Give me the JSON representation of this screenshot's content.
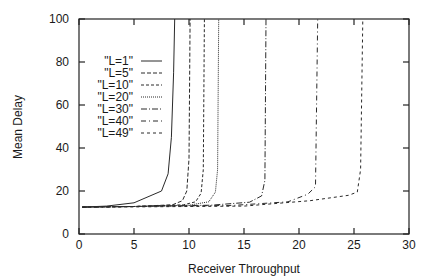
{
  "chart_data": {
    "type": "line",
    "title": "",
    "xlabel": "Receiver Throughput",
    "ylabel": "Mean Delay",
    "xlim": [
      0,
      30
    ],
    "ylim": [
      0,
      100
    ],
    "xticks": [
      0,
      5,
      10,
      15,
      20,
      25,
      30
    ],
    "yticks": [
      0,
      20,
      40,
      60,
      80,
      100
    ],
    "grid": false,
    "legend_position": "upper-left (inside)",
    "series": [
      {
        "name": "\"L=1\"",
        "dash": "",
        "x": [
          0.3,
          2.5,
          5.0,
          7.5,
          8.1,
          8.4,
          8.6,
          8.7
        ],
        "y": [
          12.5,
          13.0,
          14.5,
          20.0,
          28.0,
          45.0,
          75.0,
          100.0
        ]
      },
      {
        "name": "\"L=5\"",
        "dash": "4,2",
        "x": [
          0.3,
          5.0,
          8.5,
          9.4,
          9.8,
          10.0,
          10.1
        ],
        "y": [
          12.5,
          12.8,
          13.6,
          15.5,
          20.0,
          35.0,
          100.0
        ]
      },
      {
        "name": "\"L=10\"",
        "dash": "3,2",
        "x": [
          0.3,
          5.0,
          9.5,
          10.6,
          11.1,
          11.3,
          11.4
        ],
        "y": [
          12.5,
          12.8,
          13.6,
          15.0,
          19.0,
          30.0,
          100.0
        ]
      },
      {
        "name": "\"L=20\"",
        "dash": "1,1",
        "x": [
          0.3,
          5.0,
          10.0,
          11.8,
          12.4,
          12.6,
          12.7
        ],
        "y": [
          12.5,
          12.8,
          13.4,
          15.0,
          19.5,
          30.0,
          100.0
        ]
      },
      {
        "name": "\"L=30\"",
        "dash": "6,2,1,2",
        "x": [
          0.3,
          5.0,
          12.0,
          15.5,
          16.6,
          16.9,
          17.0
        ],
        "y": [
          12.5,
          12.8,
          13.4,
          14.8,
          17.7,
          25.0,
          100.0
        ]
      },
      {
        "name": "\"L=40\"",
        "dash": "5,3,1,3",
        "x": [
          0.3,
          5.0,
          14.0,
          19.0,
          20.8,
          21.5,
          21.7
        ],
        "y": [
          12.5,
          12.8,
          13.3,
          15.0,
          18.5,
          22.0,
          100.0
        ]
      },
      {
        "name": "\"L=49\"",
        "dash": "3,3",
        "x": [
          0.3,
          5.0,
          15.0,
          21.0,
          24.5,
          25.3,
          25.6,
          25.8
        ],
        "y": [
          12.5,
          12.6,
          13.0,
          15.5,
          18.0,
          19.5,
          30.0,
          100.0
        ]
      }
    ]
  }
}
